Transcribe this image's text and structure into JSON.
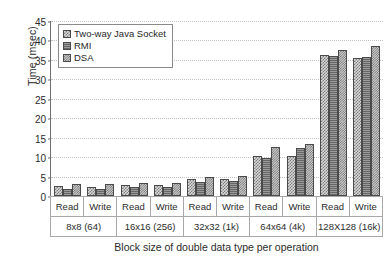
{
  "chart_data": {
    "type": "bar",
    "title": "",
    "xlabel": "Block size of double data type per operation",
    "ylabel": "Time (msec)",
    "ylim": [
      0,
      45
    ],
    "ytick_step": 5,
    "yticks": [
      "45",
      "40",
      "35",
      "30",
      "25",
      "20",
      "15",
      "10",
      "5",
      "0"
    ],
    "grid": true,
    "legend_position": "upper-left-inside",
    "operations": [
      "Read",
      "Write"
    ],
    "groups": [
      "8x8 (64)",
      "16x16 (256)",
      "32x32 (1k)",
      "64x64 (4k)",
      "128X128 (16k)"
    ],
    "categories": [
      "8x8 (64) Read",
      "8x8 (64) Write",
      "16x16 (256) Read",
      "16x16 (256) Write",
      "32x32 (1k) Read",
      "32x32 (1k) Write",
      "64x64 (4k) Read",
      "64x64 (4k) Write",
      "128X128 (16k) Read",
      "128X128 (16k) Write"
    ],
    "series": [
      {
        "name": "Two-way Java Socket",
        "pattern": "checker-light",
        "values": [
          2.6,
          2.4,
          2.9,
          2.8,
          4.4,
          4.4,
          10.3,
          10.3,
          36.2,
          35.6
        ]
      },
      {
        "name": "RMI",
        "pattern": "horizontal-lines-dark",
        "values": [
          1.8,
          1.8,
          2.2,
          2.3,
          3.7,
          3.9,
          9.9,
          12.4,
          36.0,
          35.7
        ]
      },
      {
        "name": "DSA",
        "pattern": "checker-fine",
        "values": [
          3.1,
          3.2,
          3.3,
          3.4,
          4.9,
          5.2,
          12.5,
          13.3,
          37.5,
          38.7
        ]
      }
    ]
  },
  "colors": {
    "axis": "#6f6f6f",
    "grid": "#c2c2c2",
    "text": "#2b2b2b",
    "series_0": "#d8d8d8",
    "series_1": "#9a9a9a",
    "series_2": "#cfcfcf",
    "bar_outline": "#4a4a4a",
    "background": "#ffffff"
  }
}
